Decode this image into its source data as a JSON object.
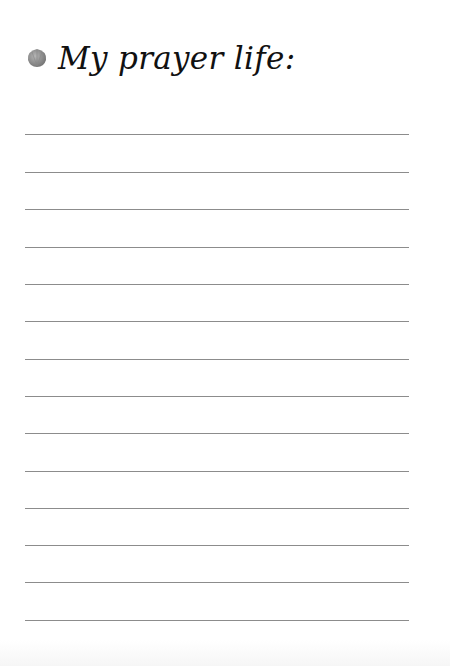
{
  "page": {
    "title": "My prayer life:",
    "icon": "shell-icon",
    "line_count": 14,
    "line_color": "#8c8c8c"
  }
}
